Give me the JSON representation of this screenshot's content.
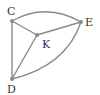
{
  "diagram": {
    "type": "graph",
    "nodes": [
      {
        "id": "C",
        "label": "C",
        "x": 12,
        "y": 21,
        "lx": 7,
        "ly": 15
      },
      {
        "id": "E",
        "label": "E",
        "x": 81,
        "y": 22,
        "lx": 85,
        "ly": 26
      },
      {
        "id": "K",
        "label": "K",
        "x": 37,
        "y": 35,
        "lx": 42,
        "ly": 48
      },
      {
        "id": "D",
        "label": "D",
        "x": 12,
        "y": 79,
        "lx": 7,
        "ly": 93
      }
    ],
    "edges": [
      {
        "from": "C",
        "to": "E",
        "curved": true
      },
      {
        "from": "C",
        "to": "K",
        "curved": false
      },
      {
        "from": "C",
        "to": "D",
        "curved": false
      },
      {
        "from": "K",
        "to": "E",
        "curved": false
      },
      {
        "from": "K",
        "to": "D",
        "curved": false
      },
      {
        "from": "D",
        "to": "E",
        "curved": true
      }
    ],
    "colors": {
      "edge": "#8a8a8a",
      "label": "#333333"
    }
  }
}
